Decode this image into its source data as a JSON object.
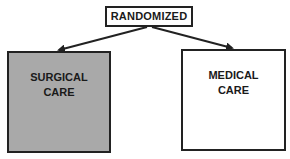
{
  "diagram": {
    "type": "flowchart",
    "root": {
      "label": "RANDOMIZED"
    },
    "branches": [
      {
        "label_line1": "SURGICAL",
        "label_line2": "CARE",
        "fill": "#a9a9a9"
      },
      {
        "label_line1": "MEDICAL",
        "label_line2": "CARE",
        "fill": "#ffffff"
      }
    ],
    "edges": [
      {
        "from": "RANDOMIZED",
        "to": "SURGICAL CARE"
      },
      {
        "from": "RANDOMIZED",
        "to": "MEDICAL CARE"
      }
    ],
    "colors": {
      "stroke": "#222222",
      "text": "#1a1a1a"
    }
  }
}
